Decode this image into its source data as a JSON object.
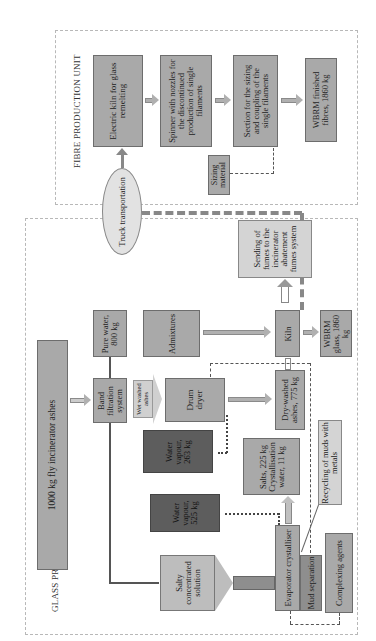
{
  "units": {
    "fibre": {
      "label": "FIBRE PRODUCTION UNIT"
    },
    "glass": {
      "label": "GLASS PRODUCTION UNIT"
    }
  },
  "fibre_nodes": {
    "electric_kiln": "Electric kiln for glass remelting",
    "spinner": "Spinner with nozzles for the discontinued production of single filaments",
    "sizing_section": "Section for the sizing and coupling of the single filaments",
    "finished_fibres": "WBRM finished fibres, 1860 kg",
    "sizing_material": "Sizing material"
  },
  "transport": {
    "truck": "Truck transportation"
  },
  "glass_nodes": {
    "fumes": "Sending of fumes to the incinerator abatement fumes system",
    "pure_water": "Pure water, 800 kg",
    "admixtures": "Admixtures",
    "ashes_input": "1000 kg fly incinerator ashes",
    "band_filtration": "Band filtration system",
    "wet_washed": "Wet washed ashes",
    "drum_dryer": "Drum dryer",
    "kiln": "Kiln",
    "wbrm_glass": "WBRM glass, 1860 kg",
    "dry_washed": "Dry-washed ashes, 775 kg",
    "water_vapour_1": "Water vapour, 263 kg",
    "salts": "Salts, 225 kg Crystallisation water, 11 kg",
    "recycling": "Recycling of muds with metals",
    "water_vapour_2": "Water vapour, 525 kg",
    "salty_solution": "Salty concentrated solution",
    "evaporator": "Evaporator crystalliser",
    "mud_separation": "Mud separation",
    "complexing": "Complexing agents"
  },
  "colors": {
    "box_medium": "#a9a9a9",
    "box_light": "#d4d4d4",
    "box_dark": "#5d5d5d",
    "unit_border": "#b8b8b8"
  }
}
